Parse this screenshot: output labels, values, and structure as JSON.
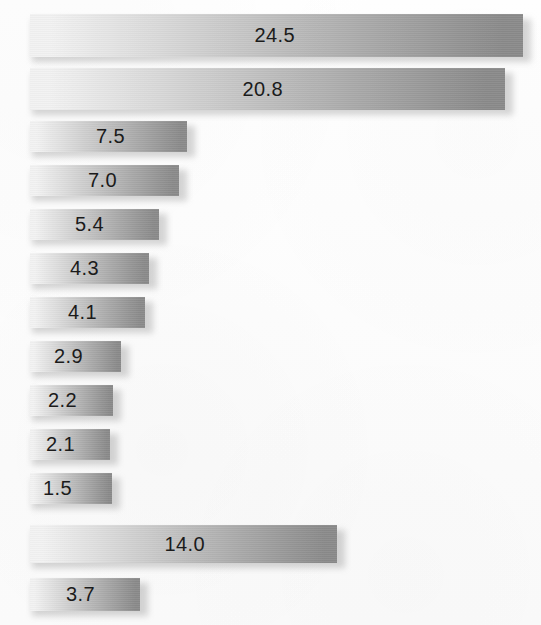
{
  "chart_data": {
    "type": "bar",
    "orientation": "horizontal",
    "title": "",
    "subtitle": "",
    "xlabel": "",
    "ylabel": "",
    "grid": false,
    "legend": false,
    "legend_position": "none",
    "axis_visible": false,
    "tick_labels": [],
    "categories": [
      "",
      "",
      "",
      "",
      "",
      "",
      "",
      "",
      "",
      "",
      "",
      "",
      ""
    ],
    "values": [
      24.5,
      20.8,
      7.5,
      7.0,
      5.4,
      4.3,
      4.1,
      2.9,
      2.2,
      2.1,
      1.5,
      14.0,
      3.7
    ],
    "data_labels": [
      "24.5",
      "20.8",
      "7.5",
      "7.0",
      "5.4",
      "4.3",
      "4.1",
      "2.9",
      "2.2",
      "2.1",
      "1.5",
      "14.0",
      "3.7"
    ],
    "xlim": [
      0,
      24.5
    ],
    "annotations": []
  },
  "style": {
    "background_color": "#fdfdfd",
    "bar_gradient_start": "#f2f2f2",
    "bar_gradient_end": "#8a8a8a",
    "label_color": "#1b1b1b",
    "shadow_color": "#787878"
  },
  "bars": [
    {
      "label": "24.5",
      "value": 24.5,
      "top": 14,
      "height": 43,
      "left": 30,
      "width": 493,
      "label_right_offset": 228
    },
    {
      "label": "20.8",
      "value": 20.8,
      "top": 68,
      "height": 42,
      "left": 30,
      "width": 475,
      "label_right_offset": 222
    },
    {
      "label": "7.5",
      "value": 7.5,
      "top": 121,
      "height": 31,
      "left": 30,
      "width": 157,
      "label_right_offset": 62
    },
    {
      "label": "7.0",
      "value": 7.0,
      "top": 165,
      "height": 31,
      "left": 30,
      "width": 149,
      "label_right_offset": 62
    },
    {
      "label": "5.4",
      "value": 5.4,
      "top": 209,
      "height": 31,
      "left": 30,
      "width": 129,
      "label_right_offset": 55
    },
    {
      "label": "4.3",
      "value": 4.3,
      "top": 253,
      "height": 31,
      "left": 30,
      "width": 119,
      "label_right_offset": 50
    },
    {
      "label": "4.1",
      "value": 4.1,
      "top": 297,
      "height": 31,
      "left": 30,
      "width": 115,
      "label_right_offset": 48
    },
    {
      "label": "2.9",
      "value": 2.9,
      "top": 341,
      "height": 31,
      "left": 30,
      "width": 91,
      "label_right_offset": 38
    },
    {
      "label": "2.2",
      "value": 2.2,
      "top": 385,
      "height": 31,
      "left": 30,
      "width": 83,
      "label_right_offset": 36
    },
    {
      "label": "2.1",
      "value": 2.1,
      "top": 429,
      "height": 31,
      "left": 30,
      "width": 80,
      "label_right_offset": 35
    },
    {
      "label": "1.5",
      "value": 1.5,
      "top": 473,
      "height": 31,
      "left": 30,
      "width": 82,
      "label_right_offset": 40
    },
    {
      "label": "14.0",
      "value": 14.0,
      "top": 525,
      "height": 38,
      "left": 30,
      "width": 307,
      "label_right_offset": 132
    },
    {
      "label": "3.7",
      "value": 3.7,
      "top": 578,
      "height": 33,
      "left": 30,
      "width": 110,
      "label_right_offset": 45
    }
  ]
}
